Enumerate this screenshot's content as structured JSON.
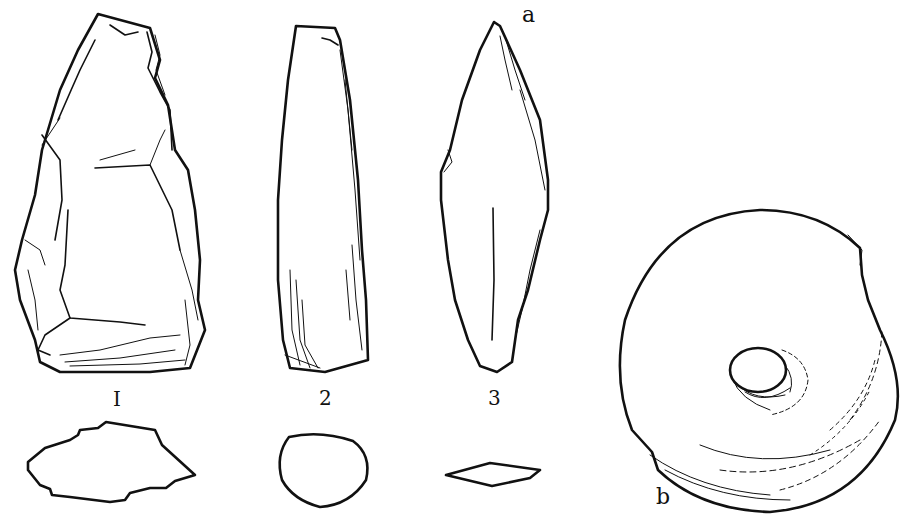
{
  "figure": {
    "ink_color": "#111111",
    "background_color": "#ffffff",
    "items": [
      {
        "id": "1",
        "label": "I",
        "description": "flaked stone hand-axe, with irregular cross-section below"
      },
      {
        "id": "2",
        "label": "2",
        "description": "ground stone celt, with rounded cross-section below"
      },
      {
        "id": "3",
        "label": "3",
        "description": "pointed lanceolate blade, with rhomboid cross-section below",
        "corner_letter": "a"
      },
      {
        "id": "b",
        "label": "b",
        "description": "perforated ring stone / mace-head"
      }
    ]
  }
}
